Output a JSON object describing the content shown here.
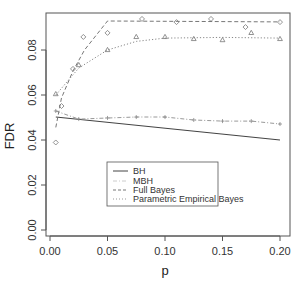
{
  "chart_data": {
    "type": "line",
    "title": "",
    "xlabel": "p",
    "ylabel": "FDR",
    "xlim": [
      -0.003,
      0.207
    ],
    "ylim": [
      -0.002,
      0.0964
    ],
    "grid": false,
    "legend_position": "center-bottom (inside plot)",
    "x_ticks": [
      "0.00",
      "0.05",
      "0.10",
      "0.15",
      "0.20"
    ],
    "y_ticks": [
      "0.00",
      "0.02",
      "0.04",
      "0.06",
      "0.08"
    ],
    "series": [
      {
        "name": "BH",
        "style": "solid",
        "marker": "none",
        "color": "#444444",
        "x": [
          0.005,
          0.2
        ],
        "values": [
          0.0502,
          0.04
        ]
      },
      {
        "name": "MBH",
        "style": "dashdot",
        "marker": "+",
        "color": "#999999",
        "x": [
          0.005,
          0.025,
          0.05,
          0.075,
          0.1,
          0.125,
          0.15,
          0.175,
          0.2
        ],
        "values": [
          0.0529,
          0.0493,
          0.0498,
          0.0502,
          0.0502,
          0.0489,
          0.0484,
          0.0484,
          0.0471
        ]
      },
      {
        "name": "Full Bayes",
        "style": "dashed",
        "marker": "diamond",
        "color": "#777777",
        "x": [
          0.005,
          0.01,
          0.02,
          0.029,
          0.05,
          0.08,
          0.11,
          0.14,
          0.17,
          0.2
        ],
        "values": [
          0.0389,
          0.0551,
          0.0716,
          0.0858,
          0.0876,
          0.0938,
          0.0924,
          0.0938,
          0.0902,
          0.0924
        ],
        "fit_line": {
          "x": [
            0.005,
            0.01,
            0.02,
            0.03,
            0.05,
            0.2
          ],
          "values": [
            0.0456,
            0.0587,
            0.0707,
            0.08,
            0.0929,
            0.0925
          ]
        }
      },
      {
        "name": "Parametric Empirical Bayes",
        "style": "dotted",
        "marker": "triangle",
        "color": "#888888",
        "x": [
          0.005,
          0.025,
          0.05,
          0.075,
          0.1,
          0.125,
          0.15,
          0.175,
          0.2
        ],
        "values": [
          0.0604,
          0.0733,
          0.08,
          0.0858,
          0.0858,
          0.0849,
          0.0844,
          0.0876,
          0.0849
        ],
        "fit_line": {
          "x": [
            0.005,
            0.025,
            0.05,
            0.075,
            0.1,
            0.15,
            0.2
          ],
          "values": [
            0.06,
            0.072,
            0.08,
            0.0838,
            0.0853,
            0.0856,
            0.0853
          ]
        }
      }
    ]
  },
  "axes": {
    "xlabel": "p",
    "ylabel": "FDR"
  },
  "legend": {
    "items": [
      {
        "label": "BH",
        "style": "solid"
      },
      {
        "label": "MBH",
        "style": "dashdot"
      },
      {
        "label": "Full Bayes",
        "style": "dashed"
      },
      {
        "label": "Parametric Empirical Bayes",
        "style": "dotted"
      }
    ]
  }
}
